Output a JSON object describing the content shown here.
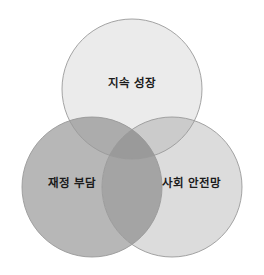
{
  "figure": {
    "type": "venn-diagram",
    "background_color": "#ffffff",
    "width": 264,
    "height": 275,
    "stroke_color": "#9a9a9a",
    "label_color": "#1b1b1b"
  },
  "chart_data": {
    "type": "venn",
    "title": "",
    "subtitle": "",
    "xlabel": "",
    "ylabel": "",
    "legend_position": "none",
    "grid": false,
    "set_count": 3,
    "sets": [
      {
        "id": "growth",
        "label": "지속 성장",
        "position": "top",
        "fill": "#ebebeb",
        "center_x": 132,
        "center_y": 89,
        "radius": 70,
        "label_x": 132,
        "label_y": 84
      },
      {
        "id": "fiscal-burden",
        "label": "재정 부담",
        "position": "bottom-left",
        "fill": "#b7b7b7",
        "center_x": 92,
        "center_y": 187,
        "radius": 70,
        "label_x": 72,
        "label_y": 184
      },
      {
        "id": "safety-net",
        "label": "사회 안전망",
        "position": "bottom-right",
        "fill": "#dcdcdc",
        "center_x": 172,
        "center_y": 187,
        "radius": 70,
        "label_x": 192,
        "label_y": 184
      }
    ],
    "intersections": [
      {
        "id": "growth-fiscal",
        "sets": [
          "growth",
          "fiscal-burden"
        ],
        "fill": "#acacac",
        "label": ""
      },
      {
        "id": "growth-safety",
        "sets": [
          "growth",
          "safety-net"
        ],
        "fill": "#cbcbcb",
        "label": ""
      },
      {
        "id": "fiscal-safety",
        "sets": [
          "fiscal-burden",
          "safety-net"
        ],
        "fill": "#a4a4a4",
        "label": ""
      },
      {
        "id": "growth-fiscal-safety",
        "sets": [
          "growth",
          "fiscal-burden",
          "safety-net"
        ],
        "fill": "#9a9a9a",
        "label": ""
      }
    ]
  }
}
